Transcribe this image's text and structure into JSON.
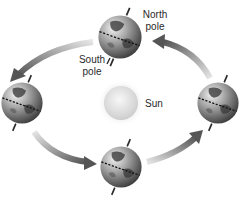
{
  "diagram": {
    "labels": {
      "north_pole_line1": "North",
      "north_pole_line2": "pole",
      "south_pole_line1": "South",
      "south_pole_line2": "pole",
      "sun": "Sun"
    },
    "nodes": [
      {
        "id": "earth-top",
        "label": "Earth",
        "cx": 120,
        "cy": 37,
        "r": 22
      },
      {
        "id": "earth-left",
        "label": "Earth",
        "cx": 22,
        "cy": 103,
        "r": 21
      },
      {
        "id": "earth-bottom",
        "label": "Earth",
        "cx": 121,
        "cy": 167,
        "r": 21
      },
      {
        "id": "earth-right",
        "label": "Earth",
        "cx": 218,
        "cy": 103,
        "r": 21
      },
      {
        "id": "sun",
        "label": "Sun",
        "cx": 121,
        "cy": 103,
        "r": 17
      }
    ],
    "edges": [
      {
        "from": "earth-top",
        "to": "earth-left",
        "direction": "counter-clockwise"
      },
      {
        "from": "earth-left",
        "to": "earth-bottom",
        "direction": "counter-clockwise"
      },
      {
        "from": "earth-bottom",
        "to": "earth-right",
        "direction": "counter-clockwise"
      },
      {
        "from": "earth-right",
        "to": "earth-top",
        "direction": "counter-clockwise"
      }
    ],
    "colors": {
      "arrow_dark": "#5a5a5a",
      "arrow_light": "#dcdcdc",
      "globe_dark": "#3a3a3a",
      "globe_light": "#e8e8e8",
      "sun": "#d9d9d9"
    }
  }
}
